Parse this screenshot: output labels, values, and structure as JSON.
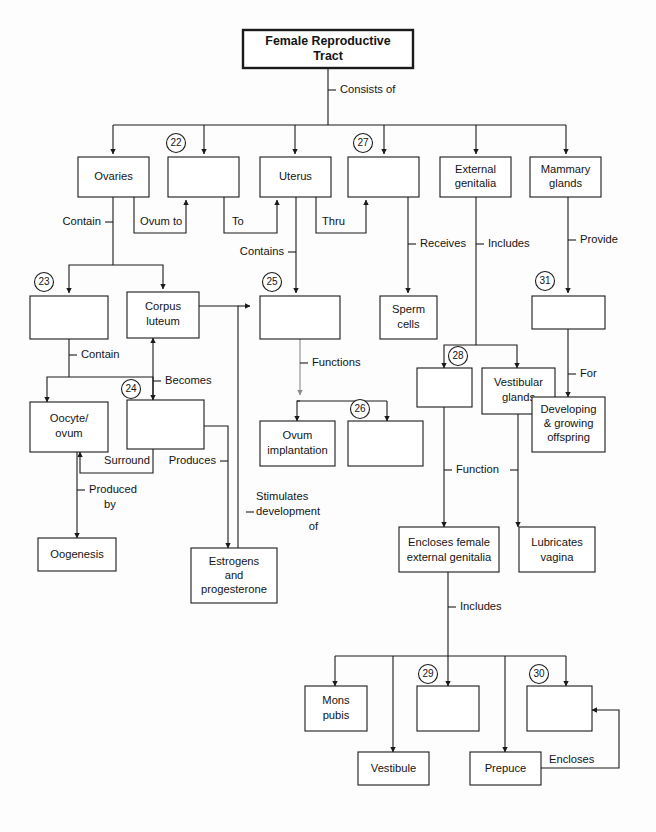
{
  "document": {
    "title": "Female Reproductive Tract Concept Map",
    "type": "flowchart-worksheet"
  },
  "nodes": [
    {
      "id": "title",
      "label": "Female Reproductive\nTract",
      "x": 243,
      "y": 30,
      "w": 170,
      "h": 38,
      "title": true,
      "ref": null
    },
    {
      "id": "ovaries",
      "label": "Ovaries",
      "x": 78,
      "y": 157,
      "w": 71,
      "h": 40,
      "ref": null
    },
    {
      "id": "blank22",
      "label": "",
      "x": 168,
      "y": 157,
      "w": 71,
      "h": 40,
      "ref": "22"
    },
    {
      "id": "uterus",
      "label": "Uterus",
      "x": 260,
      "y": 157,
      "w": 71,
      "h": 40,
      "ref": null
    },
    {
      "id": "blank27",
      "label": "",
      "x": 348,
      "y": 157,
      "w": 71,
      "h": 40,
      "ref": "27"
    },
    {
      "id": "extgen",
      "label": "External\ngenitalia",
      "x": 440,
      "y": 157,
      "w": 71,
      "h": 40,
      "ref": null
    },
    {
      "id": "mammary",
      "label": "Mammary\nglands",
      "x": 530,
      "y": 157,
      "w": 71,
      "h": 40,
      "ref": null
    },
    {
      "id": "blank23",
      "label": "",
      "x": 30,
      "y": 296,
      "w": 78,
      "h": 43,
      "ref": "23"
    },
    {
      "id": "corpus",
      "label": "Corpus\nluteum",
      "x": 127,
      "y": 292,
      "w": 72,
      "h": 43,
      "ref": null
    },
    {
      "id": "blank25",
      "label": "",
      "x": 260,
      "y": 296,
      "w": 80,
      "h": 43,
      "ref": "25"
    },
    {
      "id": "sperm",
      "label": "Sperm\ncells",
      "x": 382,
      "y": 296,
      "w": 56,
      "h": 43,
      "ref": null
    },
    {
      "id": "blank31",
      "label": "",
      "x": 532,
      "y": 296,
      "w": 73,
      "h": 33,
      "ref": "31"
    },
    {
      "id": "oocyte",
      "label": "Oocyte/\novum",
      "x": 30,
      "y": 405,
      "w": 78,
      "h": 44,
      "ref": null
    },
    {
      "id": "blank24",
      "label": "",
      "x": 127,
      "y": 403,
      "w": 77,
      "h": 46,
      "ref": "24"
    },
    {
      "id": "blank28",
      "label": "",
      "x": 422,
      "y": 371,
      "w": 55,
      "h": 36,
      "ref": "28"
    },
    {
      "id": "vestglands",
      "label": "Vestibular\nglands",
      "x": 482,
      "y": 371,
      "w": 73,
      "h": 43,
      "ref": null
    },
    {
      "id": "devoff",
      "label": "Developing\n& growing\noffspring",
      "x": 532,
      "y": 400,
      "w": 73,
      "h": 52,
      "ref": null
    },
    {
      "id": "ovumimp",
      "label": "Ovum\nimplantation",
      "x": 267,
      "y": 424,
      "w": 74,
      "h": 42,
      "ref": null
    },
    {
      "id": "blank26",
      "label": "",
      "x": 348,
      "y": 424,
      "w": 74,
      "h": 42,
      "ref": "26"
    },
    {
      "id": "oogenesis",
      "label": "Oogenesis",
      "x": 38,
      "y": 541,
      "w": 78,
      "h": 32,
      "ref": null
    },
    {
      "id": "estrogens",
      "label": "Estrogens\nand\nprogesterone",
      "x": 193,
      "y": 551,
      "w": 84,
      "h": 52,
      "ref": null
    },
    {
      "id": "enclosesfem",
      "label": "Encloses female\nexternal genitalia",
      "x": 400,
      "y": 530,
      "w": 98,
      "h": 42,
      "ref": null
    },
    {
      "id": "lubricates",
      "label": "Lubricates\nvagina",
      "x": 520,
      "y": 530,
      "w": 74,
      "h": 42,
      "ref": null
    },
    {
      "id": "monspubis",
      "label": "Mons\npubis",
      "x": 306,
      "y": 689,
      "w": 62,
      "h": 42,
      "ref": null
    },
    {
      "id": "blank29",
      "label": "",
      "x": 417,
      "y": 689,
      "w": 62,
      "h": 42,
      "ref": "29"
    },
    {
      "id": "blank30",
      "label": "",
      "x": 527,
      "y": 689,
      "w": 62,
      "h": 42,
      "ref": "30"
    },
    {
      "id": "vestibule",
      "label": "Vestibule",
      "x": 358,
      "y": 755,
      "w": 70,
      "h": 33,
      "ref": null
    },
    {
      "id": "prepuce",
      "label": "Prepuce",
      "x": 470,
      "y": 755,
      "w": 70,
      "h": 33,
      "ref": null
    }
  ],
  "edge_labels": [
    {
      "id": "consists-of",
      "text": "Consists of",
      "x": 336,
      "y": 90,
      "align": "start",
      "tick": "left"
    },
    {
      "id": "contain-1",
      "text": "Contain",
      "x": 102,
      "y": 222,
      "align": "end",
      "tick": "right"
    },
    {
      "id": "ovum-to",
      "text": "Ovum to",
      "x": 140,
      "y": 222,
      "align": "start",
      "tick": "none"
    },
    {
      "id": "to",
      "text": "To",
      "x": 230,
      "y": 222,
      "align": "start",
      "tick": "none"
    },
    {
      "id": "thru",
      "text": "Thru",
      "x": 320,
      "y": 222,
      "align": "start",
      "tick": "none"
    },
    {
      "id": "contains",
      "text": "Contains",
      "x": 288,
      "y": 252,
      "align": "end",
      "tick": "right"
    },
    {
      "id": "receives",
      "text": "Receives",
      "x": 420,
      "y": 244,
      "align": "start",
      "tick": "left"
    },
    {
      "id": "includes-1",
      "text": "Includes",
      "x": 498,
      "y": 244,
      "align": "start",
      "tick": "left"
    },
    {
      "id": "provide",
      "text": "Provide",
      "x": 578,
      "y": 240,
      "align": "start",
      "tick": "left"
    },
    {
      "id": "contain-2",
      "text": "Contain",
      "x": 78,
      "y": 355,
      "align": "start",
      "tick": "left"
    },
    {
      "id": "becomes",
      "text": "Becomes",
      "x": 172,
      "y": 381,
      "align": "start",
      "tick": "left"
    },
    {
      "id": "functions",
      "text": "Functions",
      "x": 308,
      "y": 363,
      "align": "start",
      "tick": "left"
    },
    {
      "id": "surround",
      "text": "Surround",
      "x": 104,
      "y": 461,
      "align": "start",
      "tick": "none"
    },
    {
      "id": "produces",
      "text": "Produces",
      "x": 175,
      "y": 461,
      "align": "end",
      "tick": "right"
    },
    {
      "id": "for",
      "text": "For",
      "x": 578,
      "y": 374,
      "align": "start",
      "tick": "left"
    },
    {
      "id": "function",
      "text": "Function",
      "x": 456,
      "y": 470,
      "align": "start",
      "tick": "both"
    },
    {
      "id": "produced-by",
      "text": "Produced\nby",
      "x": 86,
      "y": 497,
      "align": "start",
      "tick": "left"
    },
    {
      "id": "stimulates",
      "text": "Stimulates\ndevelopment\nof",
      "x": 256,
      "y": 513,
      "align": "start",
      "tick": "left"
    },
    {
      "id": "includes-2",
      "text": "Includes",
      "x": 458,
      "y": 607,
      "align": "start",
      "tick": "left"
    },
    {
      "id": "encloses",
      "text": "Encloses",
      "x": 559,
      "y": 760,
      "align": "start",
      "tick": "none"
    }
  ],
  "ref_numbers": [
    "22",
    "23",
    "24",
    "25",
    "26",
    "27",
    "28",
    "29",
    "30",
    "31"
  ],
  "colors": {
    "ink": "#1a1a1a",
    "paper": "#fdfdfd",
    "box_fill": "#ffffff",
    "faint_line": "#8a8a8a"
  }
}
